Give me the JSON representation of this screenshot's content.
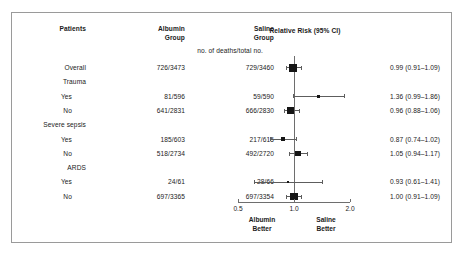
{
  "figure": {
    "headers": {
      "patients": "Patients",
      "albumin_line1": "Albumin",
      "albumin_line2": "Group",
      "saline_line1": "Saline",
      "saline_line2": "Group",
      "units_subheader": "no. of deaths/total no.",
      "relative_risk": "Relative Risk (95% CI)"
    },
    "axis": {
      "ticks": [
        "0.5",
        "1.0",
        "2.0"
      ],
      "left_footer_line1": "Albumin",
      "left_footer_line2": "Better",
      "right_footer_line1": "Saline",
      "right_footer_line2": "Better"
    },
    "rows": [
      {
        "label": "Overall",
        "indent": 0,
        "albumin": "726/3473",
        "saline": "729/3460",
        "rr_text": "0.99 (0.91–1.09)",
        "rr": 0.99,
        "low": 0.91,
        "high": 1.09,
        "marker": 7.5,
        "plot": true
      },
      {
        "label": "Trauma",
        "indent": 0,
        "albumin": "",
        "saline": "",
        "rr_text": "",
        "plot": false
      },
      {
        "label": "Yes",
        "indent": 1,
        "albumin": "81/596",
        "saline": "59/590",
        "rr_text": "1.36 (0.99–1.86)",
        "rr": 1.36,
        "low": 0.99,
        "high": 1.86,
        "marker": 3.0,
        "plot": true
      },
      {
        "label": "No",
        "indent": 1,
        "albumin": "641/2831",
        "saline": "666/2830",
        "rr_text": "0.96 (0.88–1.06)",
        "rr": 0.96,
        "low": 0.88,
        "high": 1.06,
        "marker": 7.5,
        "plot": true
      },
      {
        "label": "Severe sepsis",
        "indent": 0,
        "albumin": "",
        "saline": "",
        "rr_text": "",
        "plot": false
      },
      {
        "label": "Yes",
        "indent": 1,
        "albumin": "185/603",
        "saline": "217/615",
        "rr_text": "0.87 (0.74–1.02)",
        "rr": 0.87,
        "low": 0.74,
        "high": 1.02,
        "marker": 4.2,
        "plot": true
      },
      {
        "label": "No",
        "indent": 1,
        "albumin": "518/2734",
        "saline": "492/2720",
        "rr_text": "1.05 (0.94–1.17)",
        "rr": 1.05,
        "low": 0.94,
        "high": 1.17,
        "marker": 5.4,
        "plot": true
      },
      {
        "label": "ARDS",
        "indent": 0,
        "albumin": "",
        "saline": "",
        "rr_text": "",
        "plot": false
      },
      {
        "label": "Yes",
        "indent": 1,
        "albumin": "24/61",
        "saline": "28/66",
        "rr_text": "0.93 (0.61–1.41)",
        "rr": 0.93,
        "low": 0.61,
        "high": 1.41,
        "marker": 2.0,
        "plot": true
      },
      {
        "label": "No",
        "indent": 1,
        "albumin": "697/3365",
        "saline": "697/3354",
        "rr_text": "1.00 (0.91–1.09)",
        "rr": 1.0,
        "low": 0.91,
        "high": 1.09,
        "marker": 7.5,
        "plot": true
      }
    ]
  },
  "chart_data": {
    "type": "scatter",
    "title": "Relative Risk (95% CI)",
    "xlabel": "Relative Risk",
    "ylabel": "Patients",
    "scale": "log",
    "xlim": [
      0.5,
      2.0
    ],
    "xticks": [
      0.5,
      1.0,
      2.0
    ],
    "null_value": 1.0,
    "grid": false,
    "legend": "none",
    "annotations": [
      "Albumin Better",
      "Saline Better",
      "no. of deaths/total no."
    ],
    "categories": [
      "Overall",
      "Trauma: Yes",
      "Trauma: No",
      "Severe sepsis: Yes",
      "Severe sepsis: No",
      "ARDS: Yes",
      "ARDS: No"
    ],
    "values": [
      0.99,
      1.36,
      0.96,
      0.87,
      1.05,
      0.93,
      1.0
    ],
    "ci_low": [
      0.91,
      0.99,
      0.88,
      0.74,
      0.94,
      0.61,
      0.91
    ],
    "ci_high": [
      1.09,
      1.86,
      1.06,
      1.02,
      1.17,
      1.41,
      1.09
    ],
    "albumin_deaths_total": [
      "726/3473",
      "81/596",
      "641/2831",
      "185/603",
      "518/2734",
      "24/61",
      "697/3365"
    ],
    "saline_deaths_total": [
      "729/3460",
      "59/590",
      "666/2830",
      "217/615",
      "492/2720",
      "28/66",
      "697/3354"
    ]
  }
}
